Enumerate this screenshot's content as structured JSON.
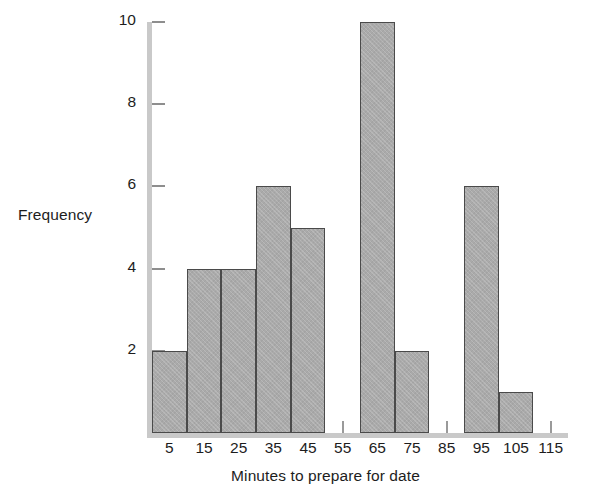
{
  "chart_data": {
    "type": "bar",
    "title": "",
    "xlabel": "Minutes to prepare for date",
    "ylabel": "Frequency",
    "categories": [
      "5",
      "15",
      "25",
      "35",
      "45",
      "55",
      "65",
      "75",
      "85",
      "95",
      "105",
      "115"
    ],
    "values": [
      2,
      4,
      4,
      6,
      5,
      0,
      10,
      2,
      0,
      6,
      1,
      0
    ],
    "ylim": [
      0,
      10
    ],
    "yticks": [
      0,
      2,
      4,
      6,
      8,
      10
    ],
    "ytick_labels": [
      "0",
      "2",
      "4",
      "6",
      "8",
      "10"
    ],
    "xtick_labels": [
      "5",
      "15",
      "25",
      "35",
      "45",
      "55",
      "65",
      "75",
      "85",
      "95",
      "105",
      "115"
    ],
    "bin_width": 10,
    "grid": false,
    "legend": false,
    "bar_fill_color": "#aaaaaa",
    "bar_edge_color": "#4a4a4a",
    "axis_color": "#c9c9c9",
    "background_color": "#ffffff"
  },
  "axes": {
    "y_title": "Frequency",
    "x_title": "Minutes to prepare for date"
  }
}
